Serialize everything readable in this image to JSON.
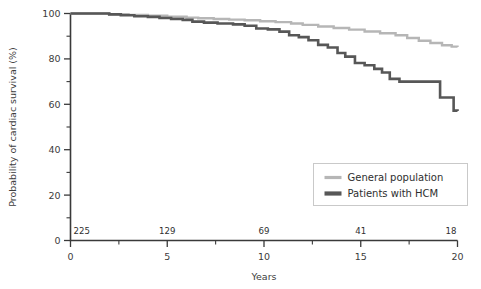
{
  "chart_data": {
    "type": "line",
    "title": "",
    "xlabel": "Years",
    "ylabel": "Probability of cardiac survival (%)",
    "xlim": [
      0,
      20
    ],
    "ylim": [
      0,
      100
    ],
    "grid": false,
    "legend_position": "bottom-right",
    "x_ticks_major": [
      "0",
      "5",
      "10",
      "15",
      "20"
    ],
    "x_ticks_major_values": [
      0,
      5,
      10,
      15,
      20
    ],
    "x_ticks_minor_values": [
      2.5,
      7.5,
      12.5,
      17.5
    ],
    "y_ticks_major": [
      "0",
      "20",
      "40",
      "60",
      "80",
      "100"
    ],
    "y_ticks_major_values": [
      0,
      20,
      40,
      60,
      80,
      100
    ],
    "y_ticks_minor_values": [
      10,
      30,
      50,
      70,
      90
    ],
    "at_risk_label_row": {
      "values": [
        "225",
        "129",
        "69",
        "41",
        "18"
      ],
      "at_x": [
        0,
        5,
        10,
        15,
        20
      ]
    },
    "series": [
      {
        "name": "General population",
        "color": "#b6b6b6",
        "stroke_width": 2.4,
        "step": "post",
        "points": [
          [
            0.0,
            100.0
          ],
          [
            1.2,
            100.0
          ],
          [
            2.0,
            99.7
          ],
          [
            3.0,
            99.4
          ],
          [
            4.0,
            99.0
          ],
          [
            5.0,
            98.6
          ],
          [
            6.0,
            98.2
          ],
          [
            6.6,
            97.9
          ],
          [
            7.4,
            97.6
          ],
          [
            8.2,
            97.3
          ],
          [
            9.0,
            97.0
          ],
          [
            9.8,
            96.6
          ],
          [
            10.6,
            96.2
          ],
          [
            11.4,
            95.6
          ],
          [
            12.0,
            95.0
          ],
          [
            12.8,
            94.3
          ],
          [
            13.6,
            93.6
          ],
          [
            14.4,
            92.9
          ],
          [
            15.2,
            92.1
          ],
          [
            16.0,
            91.3
          ],
          [
            16.8,
            90.4
          ],
          [
            17.4,
            89.2
          ],
          [
            18.0,
            88.0
          ],
          [
            18.6,
            87.0
          ],
          [
            19.2,
            86.0
          ],
          [
            19.7,
            85.4
          ],
          [
            20.0,
            85.2
          ]
        ]
      },
      {
        "name": "Patients with HCM",
        "color": "#575757",
        "stroke_width": 2.6,
        "step": "post",
        "points": [
          [
            0.0,
            100.0
          ],
          [
            1.0,
            100.0
          ],
          [
            2.0,
            99.6
          ],
          [
            2.6,
            99.2
          ],
          [
            3.3,
            98.8
          ],
          [
            4.0,
            98.5
          ],
          [
            4.6,
            98.0
          ],
          [
            5.2,
            97.6
          ],
          [
            5.8,
            97.2
          ],
          [
            6.3,
            96.4
          ],
          [
            6.9,
            96.0
          ],
          [
            7.6,
            95.6
          ],
          [
            8.4,
            95.2
          ],
          [
            9.0,
            94.6
          ],
          [
            9.6,
            93.4
          ],
          [
            10.2,
            93.0
          ],
          [
            10.8,
            92.0
          ],
          [
            11.3,
            90.4
          ],
          [
            11.8,
            89.6
          ],
          [
            12.3,
            88.2
          ],
          [
            12.8,
            86.2
          ],
          [
            13.3,
            85.0
          ],
          [
            13.8,
            82.6
          ],
          [
            14.2,
            81.0
          ],
          [
            14.7,
            78.2
          ],
          [
            15.2,
            77.2
          ],
          [
            15.7,
            75.6
          ],
          [
            16.1,
            74.0
          ],
          [
            16.5,
            71.2
          ],
          [
            17.0,
            70.0
          ],
          [
            18.9,
            70.0
          ],
          [
            19.1,
            63.0
          ],
          [
            19.6,
            63.0
          ],
          [
            19.8,
            57.2
          ],
          [
            20.0,
            57.0
          ]
        ]
      }
    ]
  },
  "legend": {
    "entries": [
      {
        "label": "General population",
        "color": "#b6b6b6"
      },
      {
        "label": "Patients with HCM",
        "color": "#575757"
      }
    ]
  }
}
